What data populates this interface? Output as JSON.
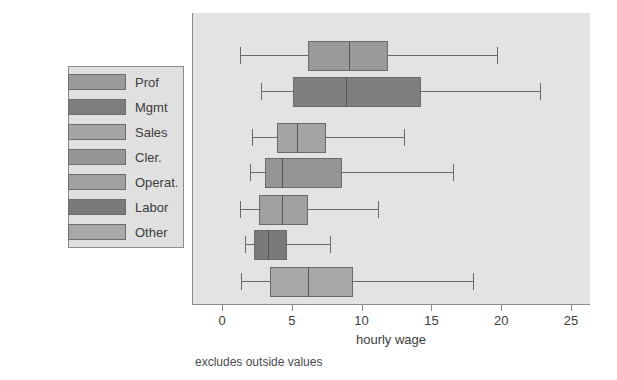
{
  "chart_data": {
    "type": "box",
    "title": "",
    "xlabel": "hourly wage",
    "ylabel": "",
    "xlim": [
      0,
      25
    ],
    "xticks": [
      0,
      5,
      10,
      15,
      20,
      25
    ],
    "xtick_labels": [
      "0",
      "5",
      "10",
      "15",
      "20",
      "25"
    ],
    "grid": false,
    "legend_position": "left-outside",
    "footnote": "excludes outside values",
    "categories": [
      "Prof",
      "Mgmt",
      "Sales",
      "Cler.",
      "Operat.",
      "Labor",
      "Other"
    ],
    "boxes": [
      {
        "label": "Prof",
        "whisker_low": 1.2,
        "q1": 6.1,
        "median": 9.0,
        "q3": 11.8,
        "whisker_high": 19.6,
        "color": "#9a9a9a"
      },
      {
        "label": "Mgmt",
        "whisker_low": 2.7,
        "q1": 5.0,
        "median": 8.8,
        "q3": 14.2,
        "whisker_high": 22.7,
        "color": "#7e7e7e"
      },
      {
        "label": "Sales",
        "whisker_low": 2.1,
        "q1": 3.9,
        "median": 5.3,
        "q3": 7.4,
        "whisker_high": 13.0,
        "color": "#a4a4a4"
      },
      {
        "label": "Cler.",
        "whisker_low": 1.9,
        "q1": 3.0,
        "median": 4.2,
        "q3": 8.5,
        "whisker_high": 16.5,
        "color": "#959595"
      },
      {
        "label": "Operat.",
        "whisker_low": 1.2,
        "q1": 2.6,
        "median": 4.2,
        "q3": 6.1,
        "whisker_high": 11.1,
        "color": "#a0a0a0"
      },
      {
        "label": "Labor",
        "whisker_low": 1.6,
        "q1": 2.2,
        "median": 3.2,
        "q3": 4.6,
        "whisker_high": 7.7,
        "color": "#7a7a7a"
      },
      {
        "label": "Other",
        "whisker_low": 1.3,
        "q1": 3.4,
        "median": 6.1,
        "q3": 9.3,
        "whisker_high": 17.9,
        "color": "#a8a8a8"
      }
    ]
  },
  "legend": {
    "items": [
      {
        "label": "Prof",
        "color": "#9a9a9a"
      },
      {
        "label": "Mgmt",
        "color": "#7e7e7e"
      },
      {
        "label": "Sales",
        "color": "#a4a4a4"
      },
      {
        "label": "Cler.",
        "color": "#959595"
      },
      {
        "label": "Operat.",
        "color": "#a0a0a0"
      },
      {
        "label": "Labor",
        "color": "#7a7a7a"
      },
      {
        "label": "Other",
        "color": "#a8a8a8"
      }
    ]
  },
  "colors": {
    "plot_background": "#e3e3e3",
    "legend_background": "#e0e0e0",
    "axis": "#8b8b8b",
    "outline": "#6a6a6a",
    "text": "#3c3c3c",
    "page_background": "#ffffff"
  }
}
